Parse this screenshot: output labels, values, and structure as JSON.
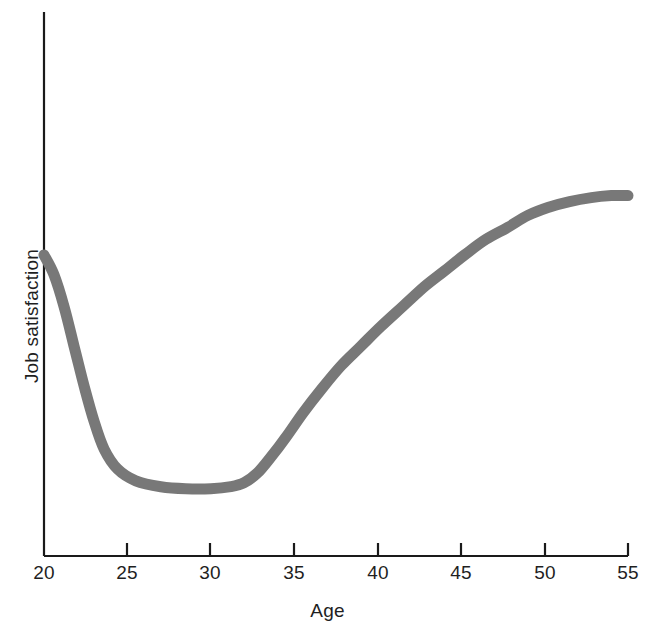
{
  "chart_data": {
    "type": "line",
    "title": "",
    "subtitle": "",
    "xlabel": "Age",
    "ylabel": "Job satisfaction",
    "xticks": [
      "20",
      "25",
      "30",
      "35",
      "40",
      "45",
      "50",
      "55"
    ],
    "xtick_values": [
      20,
      25,
      30,
      35,
      40,
      45,
      50,
      55
    ],
    "yticks": [],
    "xlim": [
      20,
      55
    ],
    "ylim": [
      0,
      100
    ],
    "grid": false,
    "legend": null,
    "line_color": "#787878",
    "axis_color": "#1a1a1a",
    "annotations": [],
    "series": [
      {
        "name": "Job satisfaction",
        "x": [
          20,
          20.6,
          21.2,
          21.8,
          22.4,
          23.0,
          23.6,
          24.4,
          25.5,
          27.0,
          28.5,
          30.0,
          31.2,
          32.0,
          32.8,
          33.6,
          34.5,
          35.5,
          36.6,
          37.8,
          39.0,
          40.2,
          41.5,
          42.8,
          44.0,
          45.2,
          46.5,
          47.8,
          49.0,
          50.2,
          51.5,
          52.8,
          54.0,
          55.0
        ],
        "y": [
          76,
          71,
          63,
          53,
          43,
          34,
          27,
          22,
          19,
          17.5,
          17,
          17,
          17.5,
          18.5,
          21,
          25,
          30,
          36,
          42,
          48,
          53,
          58,
          63,
          68,
          72,
          76,
          80,
          83,
          86,
          88,
          89.5,
          90.5,
          91,
          91
        ]
      }
    ]
  },
  "axis": {
    "x_title": "Age",
    "y_title": "Job satisfaction"
  }
}
